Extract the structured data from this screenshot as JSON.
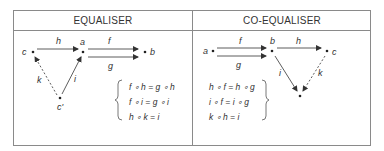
{
  "table": {
    "columns": [
      {
        "header": "EQUALISER",
        "objects": [
          "a",
          "b",
          "c"
        ],
        "arrows": [
          {
            "label": "h",
            "from": "c",
            "to": "a",
            "style": "solid"
          },
          {
            "label": "f",
            "from": "a",
            "to": "b",
            "style": "solid"
          },
          {
            "label": "g",
            "from": "a",
            "to": "b",
            "style": "solid"
          },
          {
            "label": "i",
            "from": "c'",
            "to": "a",
            "style": "solid"
          },
          {
            "label": "k",
            "from": "c'",
            "to": "c",
            "style": "dashed"
          }
        ],
        "node_labels": {
          "c": "c",
          "a": "a",
          "b": "b",
          "c_prime": "c'"
        },
        "equations": [
          "f ∘ h = g ∘ h",
          "f ∘ i = g ∘ i",
          "h ∘ k = i"
        ]
      },
      {
        "header": "CO-EQUALISER",
        "objects": [
          "a",
          "b",
          "c"
        ],
        "arrows": [
          {
            "label": "f",
            "from": "a",
            "to": "b",
            "style": "solid"
          },
          {
            "label": "g",
            "from": "a",
            "to": "b",
            "style": "solid"
          },
          {
            "label": "h",
            "from": "b",
            "to": "c",
            "style": "solid"
          },
          {
            "label": "i",
            "from": "b",
            "to": "c'",
            "style": "solid"
          },
          {
            "label": "k",
            "from": "c",
            "to": "c'",
            "style": "dashed"
          }
        ],
        "node_labels": {
          "a": "a",
          "b": "b",
          "c": "c"
        },
        "equations": [
          "h ∘ f = h ∘ g",
          "i ∘ f = i ∘ g",
          "k ∘ h = i"
        ]
      }
    ]
  }
}
